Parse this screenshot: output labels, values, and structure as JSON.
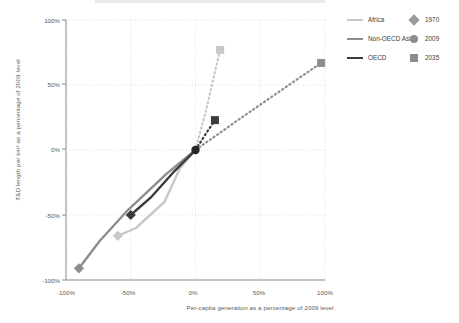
{
  "chart_data": {
    "type": "line",
    "title": "",
    "xlabel": "Per-capita generation as a percentage of 2009 level",
    "ylabel": "T&D length per km² as a percentage of 2009 level",
    "xlim": [
      -100,
      100
    ],
    "ylim": [
      -100,
      100
    ],
    "xticks": [
      "-100%",
      "-50%",
      "0%",
      "50%",
      "100%"
    ],
    "xtick_values": [
      -100,
      -50,
      0,
      50,
      100
    ],
    "yticks": [
      "-100%",
      "-50%",
      "0%",
      "50%",
      "100%"
    ],
    "ytick_values": [
      -100,
      -50,
      0,
      50,
      100
    ],
    "grid": true,
    "legend_position": "top-right",
    "marker_legend": [
      {
        "label": "1970",
        "shape": "diamond",
        "color": "#9a9a9a"
      },
      {
        "label": "2009",
        "shape": "circle",
        "color": "#8c8c8c"
      },
      {
        "label": "2035",
        "shape": "square",
        "color": "#8c8c8c"
      }
    ],
    "series": [
      {
        "name": "Africa",
        "color": "#c8c8c8",
        "historical": [
          {
            "x": -60,
            "y": -66,
            "year": 1970,
            "marker": "diamond"
          },
          {
            "x": -46,
            "y": -60
          },
          {
            "x": -24,
            "y": -40
          },
          {
            "x": -12,
            "y": -14
          },
          {
            "x": 0,
            "y": 0,
            "year": 2009,
            "marker": "circle"
          }
        ],
        "projection": [
          {
            "x": 0,
            "y": 0,
            "year": 2009
          },
          {
            "x": 8,
            "y": 30
          },
          {
            "x": 19,
            "y": 77,
            "year": 2035,
            "marker": "square"
          }
        ]
      },
      {
        "name": "Non-OECD Asia",
        "color": "#8e8e8e",
        "historical": [
          {
            "x": -90,
            "y": -91,
            "year": 1970,
            "marker": "diamond"
          },
          {
            "x": -74,
            "y": -70
          },
          {
            "x": -52,
            "y": -46
          },
          {
            "x": -22,
            "y": -18
          },
          {
            "x": 0,
            "y": 0,
            "year": 2009,
            "marker": "circle"
          }
        ],
        "projection": [
          {
            "x": 0,
            "y": 0,
            "year": 2009
          },
          {
            "x": 40,
            "y": 28
          },
          {
            "x": 97,
            "y": 67,
            "year": 2035,
            "marker": "square"
          }
        ]
      },
      {
        "name": "OECD",
        "color": "#3c3c3c",
        "historical": [
          {
            "x": -50,
            "y": -50,
            "year": 1970,
            "marker": "diamond"
          },
          {
            "x": -34,
            "y": -36
          },
          {
            "x": -16,
            "y": -16
          },
          {
            "x": 0,
            "y": 0,
            "year": 2009,
            "marker": "circle"
          }
        ],
        "projection": [
          {
            "x": 0,
            "y": 0,
            "year": 2009
          },
          {
            "x": 7,
            "y": 11
          },
          {
            "x": 15,
            "y": 23,
            "year": 2035,
            "marker": "square"
          }
        ]
      }
    ]
  },
  "legend": {
    "series": [
      {
        "label": "Africa"
      },
      {
        "label": "Non-OECD Asia"
      },
      {
        "label": "OECD"
      }
    ],
    "markers": [
      {
        "label": "1970"
      },
      {
        "label": "2009"
      },
      {
        "label": "2035"
      }
    ]
  },
  "axes": {
    "y_title": "T&D length per km² as a percentage of 2009 level",
    "x_title": "Per-capita generation as a percentage of 2009 level",
    "y_ticks": [
      "100%",
      "50%",
      "0%",
      "-50%",
      "-100%"
    ],
    "x_ticks": [
      "-100%",
      "-50%",
      "0%",
      "50%",
      "100%"
    ]
  }
}
